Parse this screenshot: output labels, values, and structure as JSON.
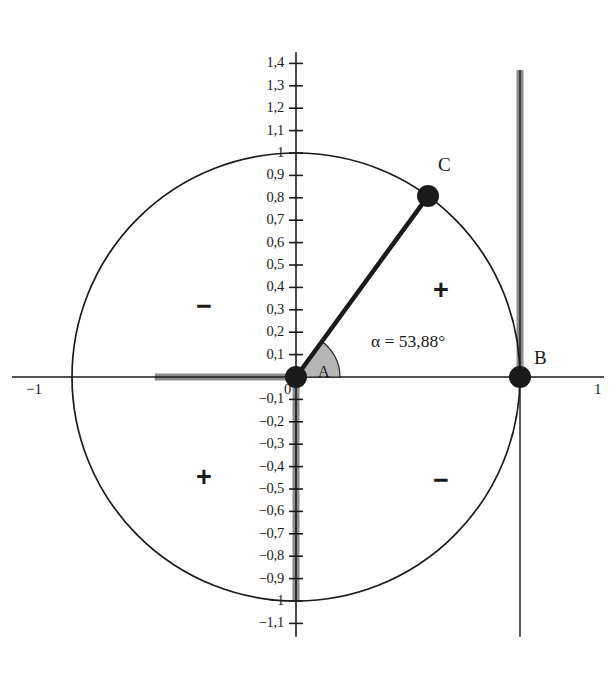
{
  "diagram": {
    "title_semantic": "unit-circle-trigonometry",
    "colors": {
      "stroke": "#1a1a1a",
      "background": "#ffffff",
      "highlight_band": "#8c8c8c",
      "sector_fill": "#b5b5b5"
    },
    "geometry": {
      "origin_px": [
        296,
        377
      ],
      "radius_px": 224,
      "unit": 224,
      "angle_deg": 53.88,
      "circle_label": "unit-circle"
    },
    "points": [
      {
        "name": "A",
        "label": "A",
        "x": 0,
        "y": 0,
        "label_dx": 22,
        "label_dy": -14
      },
      {
        "name": "B",
        "label": "B",
        "x": 1,
        "y": 0,
        "label_dx": 14,
        "label_dy": -30
      },
      {
        "name": "C",
        "label": "C",
        "x": 0.5894,
        "y": 0.8078,
        "label_dx": 10,
        "label_dy": -42
      }
    ],
    "angle_annotation": {
      "text": "α = 53,88°",
      "x_px": 371,
      "y_px": 331
    },
    "quadrant_signs": [
      {
        "name": "quadrant-2-sign",
        "text": "−",
        "x_px": 204,
        "y_px": 311
      },
      {
        "name": "quadrant-1-sign",
        "text": "+",
        "x_px": 441,
        "y_px": 295
      },
      {
        "name": "quadrant-3-sign",
        "text": "+",
        "x_px": 204,
        "y_px": 482
      },
      {
        "name": "quadrant-4-sign",
        "text": "−",
        "x_px": 441,
        "y_px": 485
      }
    ],
    "x_axis": {
      "name": "x-axis",
      "left_label": "−1",
      "right_label": "1",
      "left_label_x_px": 26,
      "left_label_y_px": 381,
      "right_label_x_px": 594,
      "right_label_y_px": 381
    },
    "y_axis": {
      "name": "y-axis",
      "origin_label": "0",
      "ticks": [
        {
          "value": 1.4,
          "label": "1,4"
        },
        {
          "value": 1.3,
          "label": "1,3"
        },
        {
          "value": 1.2,
          "label": "1,2"
        },
        {
          "value": 1.1,
          "label": "1,1"
        },
        {
          "value": 1.0,
          "label": "1"
        },
        {
          "value": 0.9,
          "label": "0,9"
        },
        {
          "value": 0.8,
          "label": "0,8"
        },
        {
          "value": 0.7,
          "label": "0,7"
        },
        {
          "value": 0.6,
          "label": "0,6"
        },
        {
          "value": 0.5,
          "label": "0,5"
        },
        {
          "value": 0.4,
          "label": "0,4"
        },
        {
          "value": 0.3,
          "label": "0,3"
        },
        {
          "value": 0.2,
          "label": "0,2"
        },
        {
          "value": 0.1,
          "label": "0,1"
        },
        {
          "value": -0.1,
          "label": "−0,1"
        },
        {
          "value": -0.2,
          "label": "−0,2"
        },
        {
          "value": -0.3,
          "label": "−0,3"
        },
        {
          "value": -0.4,
          "label": "−0,4"
        },
        {
          "value": -0.5,
          "label": "−0,5"
        },
        {
          "value": -0.6,
          "label": "−0,6"
        },
        {
          "value": -0.7,
          "label": "−0,7"
        },
        {
          "value": -0.8,
          "label": "−0,8"
        },
        {
          "value": -0.9,
          "label": "−0,9"
        },
        {
          "value": -1.0,
          "label": "−1"
        },
        {
          "value": -1.1,
          "label": "−1,1"
        }
      ]
    },
    "highlight_bands": [
      {
        "name": "cosine-band",
        "orientation": "horizontal",
        "from": -0.63,
        "to": 0.0,
        "at": 0.0
      },
      {
        "name": "sine-band",
        "orientation": "vertical",
        "from": -1.0,
        "to": 0.0,
        "at": 0.0
      },
      {
        "name": "tangent-band",
        "orientation": "vertical",
        "from": 0.0,
        "to": 1.37,
        "at": 1.0
      }
    ]
  }
}
